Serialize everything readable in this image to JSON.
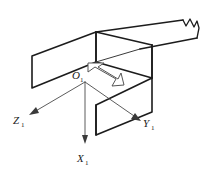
{
  "figure": {
    "background_color": "#ffffff",
    "line_color": "#1c1c1c",
    "axis_color": "#4a4a4a",
    "arrow_outline_color": "#555555",
    "arrow_fill_color": "#ffffff"
  },
  "origin": {
    "symbol": "O",
    "subscript": "1",
    "x": 85,
    "y": 80
  },
  "axes": [
    {
      "name": "x-axis",
      "symbol": "X",
      "subscript": "1",
      "direction": "down",
      "label_x": 78,
      "label_y": 160,
      "tip_x": 85,
      "tip_y": 143
    },
    {
      "name": "y-axis",
      "symbol": "Y",
      "subscript": "1",
      "direction": "down-right",
      "label_x": 143,
      "label_y": 128,
      "tip_x": 139,
      "tip_y": 120
    },
    {
      "name": "z-axis",
      "symbol": "Z",
      "subscript": "1",
      "direction": "down-left",
      "label_x": 14,
      "label_y": 125,
      "tip_x": 30,
      "tip_y": 114
    }
  ],
  "annotations": {
    "motion_arrow": {
      "name": "double-headed-arrow",
      "style": "hollow-outlined",
      "orientation": "diagonal-down-right",
      "start_x": 88,
      "start_y": 64,
      "end_x": 122,
      "end_y": 84
    },
    "break_symbol": {
      "name": "jagged-break",
      "description": "zig-zag break line at far end of right beam"
    }
  },
  "geometry": {
    "description": "Two intersecting plate/channel members drawn in isometric projection",
    "members": [
      {
        "name": "left-flange-plate",
        "kind": "parallelogram-face"
      },
      {
        "name": "top-web-plate",
        "kind": "parallelogram-face"
      },
      {
        "name": "right-beam-top-plate",
        "kind": "parallelogram-face"
      },
      {
        "name": "front-right-vertical-plate",
        "kind": "parallelogram-face"
      }
    ]
  }
}
